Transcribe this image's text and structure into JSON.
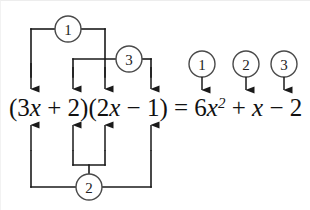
{
  "figure": {
    "background_color": "#ffffff",
    "line_color": "#1a1a1a",
    "circle_stroke_color": "#4a4a4a"
  },
  "equation": {
    "full_text": "(3x + 2)(2x − 1) = 6x² + x − 2",
    "left_side": "(3x + 2)(2x − 1)",
    "right_side": "6x² + x − 2",
    "equals_sign": "=",
    "segments": [
      {
        "id": "open-paren-1",
        "text": "("
      },
      {
        "id": "term-3x",
        "text": "3",
        "var": "x"
      },
      {
        "id": "plus-1",
        "text": " + "
      },
      {
        "id": "term-2",
        "text": "2"
      },
      {
        "id": "close-paren-1",
        "text": ")"
      },
      {
        "id": "open-paren-2",
        "text": "("
      },
      {
        "id": "term-2x",
        "text": "2",
        "var": "x"
      },
      {
        "id": "minus-1",
        "text": " − "
      },
      {
        "id": "term-1",
        "text": "1"
      },
      {
        "id": "close-paren-2",
        "text": ")"
      },
      {
        "id": "equals",
        "text": " = "
      },
      {
        "id": "term-6x2",
        "text": "6",
        "var": "x",
        "sup": "2"
      },
      {
        "id": "plus-2",
        "text": " + "
      },
      {
        "id": "term-x",
        "var": "x"
      },
      {
        "id": "minus-2",
        "text": " − "
      },
      {
        "id": "term-2b",
        "text": "2"
      }
    ]
  },
  "connectors": [
    {
      "id": "connector-1",
      "label": "1",
      "label_glyph": "①",
      "position": "above",
      "description": "outer-left bracket joining 3x and 2x",
      "circle": {
        "cx": 67,
        "cy": 28,
        "r": 13
      },
      "targets": [
        "3x",
        "2x"
      ]
    },
    {
      "id": "connector-3",
      "label": "3",
      "label_glyph": "③",
      "position": "above",
      "description": "inner bracket joining 2, 2x and 1",
      "circle": {
        "cx": 128,
        "cy": 58,
        "r": 13
      },
      "targets": [
        "2",
        "2x",
        "1"
      ]
    },
    {
      "id": "connector-2",
      "label": "2",
      "label_glyph": "②",
      "position": "below",
      "description": "outer bracket joining 3x, 2, 2x and 1",
      "circle": {
        "cx": 88,
        "cy": 186,
        "r": 13
      },
      "targets": [
        "3x",
        "2",
        "2x",
        "1"
      ]
    }
  ],
  "result_markers": [
    {
      "id": "result-marker-1",
      "label": "1",
      "label_glyph": "①",
      "cx": 201,
      "cy": 63,
      "r": 13,
      "points_to": "6x²"
    },
    {
      "id": "result-marker-2",
      "label": "2",
      "label_glyph": "②",
      "cx": 245,
      "cy": 63,
      "r": 13,
      "points_to": "x"
    },
    {
      "id": "result-marker-3",
      "label": "3",
      "label_glyph": "③",
      "cx": 283,
      "cy": 63,
      "r": 13,
      "points_to": "2"
    }
  ],
  "arrows_down": [
    {
      "id": "arrow-down-3x",
      "x": 30,
      "points_to": "3x"
    },
    {
      "id": "arrow-down-2",
      "x": 72,
      "points_to": "2"
    },
    {
      "id": "arrow-down-2x",
      "x": 104,
      "points_to": "2x"
    },
    {
      "id": "arrow-down-1",
      "x": 150,
      "points_to": "1"
    }
  ],
  "arrows_up": [
    {
      "id": "arrow-up-3x",
      "x": 30,
      "points_to": "3x"
    },
    {
      "id": "arrow-up-2",
      "x": 72,
      "points_to": "2"
    },
    {
      "id": "arrow-up-2x",
      "x": 104,
      "points_to": "2x"
    },
    {
      "id": "arrow-up-1",
      "x": 150,
      "points_to": "1"
    }
  ]
}
